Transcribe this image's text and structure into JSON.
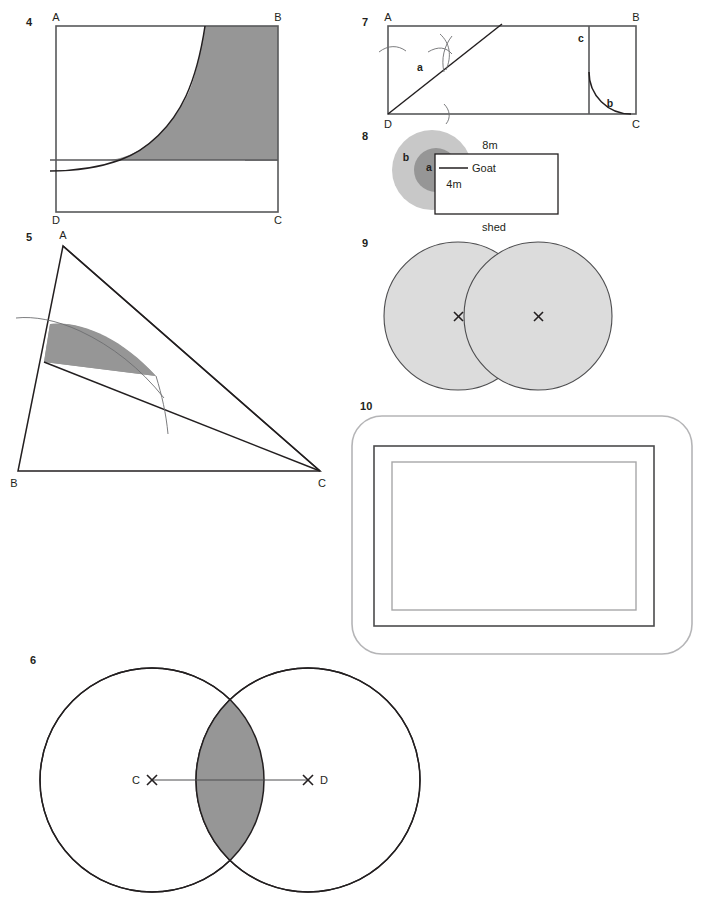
{
  "page": {
    "width": 705,
    "height": 908,
    "background": "#ffffff"
  },
  "palette": {
    "shade_mid": "#969696",
    "shade_light": "#dcdcdc",
    "shade_c8": "#c8c8c8",
    "line_gray": "#58595b",
    "line_dark": "#231f20",
    "white": "#ffffff"
  },
  "figures": [
    {
      "id": "fig-4",
      "number": "4",
      "type": "rectangle-with-curve",
      "vertices": {
        "A": "A",
        "B": "B",
        "C": "C",
        "D": "D"
      },
      "description": "Rectangle ABCD with an exponential-like curve from the bottom-left area rising to the top edge; region right of the curve and above a horizontal chord is shaded mid-gray.",
      "labels": [
        "A",
        "B",
        "C",
        "D"
      ],
      "shaded": true
    },
    {
      "id": "fig-5",
      "number": "5",
      "type": "triangle-with-arc-sector",
      "vertices": {
        "A": "A",
        "B": "B",
        "C": "C"
      },
      "description": "Triangle ABC with a cevian line drawn inside and a circular arc struck from a point on AB; the lune between the arc and the cevian is shaded mid-gray.",
      "labels": [
        "A",
        "B",
        "C"
      ],
      "shaded": true
    },
    {
      "id": "fig-6",
      "number": "6",
      "type": "two-overlapping-circles",
      "description": "Two equal white circles whose centres C and D are joined by a straight line; the lens-shaped intersection is shaded mid-gray. Centres marked with small crosses.",
      "centres": [
        {
          "label": "C",
          "mark": "x-mark"
        },
        {
          "label": "D",
          "mark": "x-mark"
        }
      ],
      "shaded": true
    },
    {
      "id": "fig-7",
      "number": "7",
      "type": "rectangle-with-construction",
      "vertices": {
        "A": "A",
        "B": "B",
        "C": "C",
        "D": "D"
      },
      "description": "Rectangle ABCD with diagonal from D marked a, compass construction arcs on side AD, across the diagonal and on DC, a vertical line near B bounding region c, and a quarter arc bounding region b.",
      "region_labels": [
        "a",
        "b",
        "c"
      ],
      "labels": [
        "A",
        "B",
        "C",
        "D"
      ],
      "shaded": false
    },
    {
      "id": "fig-8",
      "number": "8",
      "type": "goat-and-shed",
      "description": "Two concentric circles (inner darker region a inside outer lighter region b) partly covered by a white rectangular shed; a leader line marks the goat's tether point.",
      "region_labels": [
        "a",
        "b"
      ],
      "dimensions": [
        {
          "text": "8m",
          "position": "top"
        },
        {
          "text": "4m",
          "position": "left-inside"
        }
      ],
      "annotations": [
        {
          "text": "Goat",
          "has_leader_line": true
        },
        {
          "text": "shed",
          "has_leader_line": false
        }
      ],
      "shaded": true
    },
    {
      "id": "fig-9",
      "number": "9",
      "type": "two-overlapping-circles-filled",
      "description": "Two equal circles, both filled light gray, overlapping so that each centre lies on the other circle's circumference. Centres marked with small crosses.",
      "centres": [
        {
          "label": "",
          "mark": "x-mark"
        },
        {
          "label": "",
          "mark": "x-mark"
        }
      ],
      "shaded": true
    },
    {
      "id": "fig-10",
      "number": "10",
      "type": "nested-rectangles",
      "description": "An outer rounded rectangle containing two concentric plain rectangles, forming a border/frame.",
      "frames": 3,
      "shaded": false
    }
  ]
}
